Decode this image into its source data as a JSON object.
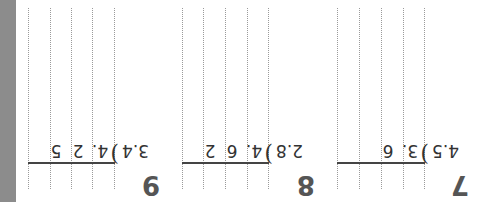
{
  "worksheet": {
    "orientation": "rotated 180 degrees",
    "problems": [
      {
        "number": "7",
        "divisor": "4.5",
        "dividend_digits": [
          "3.",
          "6"
        ],
        "dividend": "3.6"
      },
      {
        "number": "8",
        "divisor": "2.8",
        "dividend_digits": [
          "4.",
          "6",
          "2"
        ],
        "dividend": "4.62"
      },
      {
        "number": "9",
        "divisor": "3.4",
        "dividend_digits": [
          "4.",
          "2",
          "5"
        ],
        "dividend": "4.25"
      }
    ],
    "bracket_symbol": ")",
    "colors": {
      "strip": "#8c8c8c",
      "number": "#555555",
      "text": "#333333",
      "grid": "#9a9a9a"
    }
  }
}
